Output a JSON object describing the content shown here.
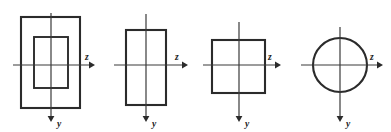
{
  "figure": {
    "background_color": "#ffffff",
    "line_color": "#2b2b2b",
    "axis_color": "#3a3a3a",
    "width": 391,
    "height": 132,
    "panel_count": 4,
    "axis_labels": {
      "horizontal": "z",
      "vertical": "y"
    },
    "panels": [
      {
        "index": 1,
        "shape": "hollow-rectangle",
        "name": "hollow box section",
        "origin": {
          "x": 51,
          "y": 65
        },
        "outer": {
          "x": 21,
          "y": 17,
          "width": 59,
          "height": 91
        },
        "inner": {
          "x": 34,
          "y": 37,
          "width": 34,
          "height": 51
        },
        "z_axis": {
          "x1": 13,
          "y1": 65,
          "x2": 91,
          "y2": 65
        },
        "y_axis": {
          "x1": 51,
          "y1": 13,
          "x2": 51,
          "y2": 118
        },
        "z_label": {
          "text": "z",
          "x": 85,
          "y": 60
        },
        "y_label": {
          "text": "y",
          "x": 58,
          "y": 125
        }
      },
      {
        "index": 2,
        "shape": "rectangle",
        "name": "tall solid rectangle",
        "origin": {
          "x": 146,
          "y": 65
        },
        "outer": {
          "x": 126,
          "y": 30,
          "width": 40,
          "height": 75
        },
        "inner": null,
        "z_axis": {
          "x1": 114,
          "y1": 65,
          "x2": 184,
          "y2": 65
        },
        "y_axis": {
          "x1": 146,
          "y1": 14,
          "x2": 146,
          "y2": 118
        },
        "z_label": {
          "text": "z",
          "x": 175,
          "y": 60
        },
        "y_label": {
          "text": "y",
          "x": 153,
          "y": 125
        }
      },
      {
        "index": 3,
        "shape": "square",
        "name": "square section",
        "origin": {
          "x": 239,
          "y": 65
        },
        "outer": {
          "x": 212,
          "y": 40,
          "width": 53,
          "height": 53
        },
        "inner": null,
        "z_axis": {
          "x1": 203,
          "y1": 65,
          "x2": 277,
          "y2": 65
        },
        "y_axis": {
          "x1": 239,
          "y1": 22,
          "x2": 239,
          "y2": 118
        },
        "z_label": {
          "text": "z",
          "x": 268,
          "y": 60
        },
        "y_label": {
          "text": "y",
          "x": 246,
          "y": 125
        }
      },
      {
        "index": 4,
        "shape": "circle",
        "name": "circular section",
        "origin": {
          "x": 340,
          "y": 65
        },
        "circle": {
          "cx": 340,
          "cy": 65,
          "r": 27
        },
        "inner": null,
        "z_axis": {
          "x1": 301,
          "y1": 65,
          "x2": 379,
          "y2": 65
        },
        "y_axis": {
          "x1": 340,
          "y1": 27,
          "x2": 340,
          "y2": 118
        },
        "z_label": {
          "text": "z",
          "x": 370,
          "y": 60
        },
        "y_label": {
          "text": "y",
          "x": 347,
          "y": 125
        }
      }
    ]
  }
}
